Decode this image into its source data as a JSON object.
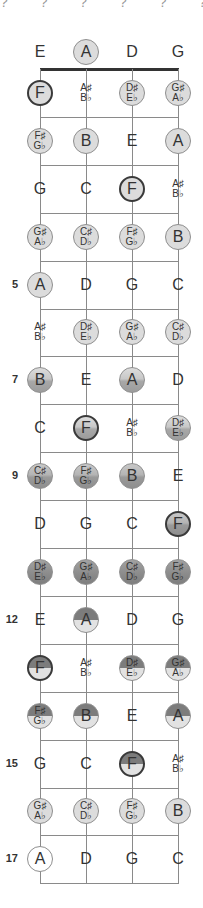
{
  "diagram": {
    "title_cut": "?  ?  ?  ?  ?  ?  ?",
    "strings": [
      "E",
      "A",
      "D",
      "G"
    ],
    "string_x": [
      40,
      86,
      132,
      178
    ],
    "nut_y": 69,
    "fret_spacing": 47.9,
    "fret_count": 17,
    "open_row_y": 52,
    "colors": {
      "line": "#8a8a8a",
      "nut": "#333333",
      "light": "#dcdcdc",
      "dark_split_top": "#7c7c7c",
      "root_border": "#3a3a3a"
    },
    "fret_markers": [
      {
        "fret": 5,
        "label": "5"
      },
      {
        "fret": 7,
        "label": "7"
      },
      {
        "fret": 9,
        "label": "9"
      },
      {
        "fret": 12,
        "label": "12"
      },
      {
        "fret": 15,
        "label": "15"
      },
      {
        "fret": 17,
        "label": "17"
      }
    ],
    "rows": [
      {
        "fret": 0,
        "cells": [
          {
            "n": [
              "E"
            ],
            "c": 0,
            "s": "none"
          },
          {
            "n": [
              "A"
            ],
            "c": 1,
            "s": "light"
          },
          {
            "n": [
              "D"
            ],
            "c": 0,
            "s": "none"
          },
          {
            "n": [
              "G"
            ],
            "c": 0,
            "s": "none"
          }
        ]
      },
      {
        "fret": 1,
        "cells": [
          {
            "n": [
              "F"
            ],
            "c": 1,
            "s": "light",
            "root": 1
          },
          {
            "n": [
              "A♯",
              "B♭"
            ],
            "c": 0,
            "s": "none"
          },
          {
            "n": [
              "D♯",
              "E♭"
            ],
            "c": 1,
            "s": "light"
          },
          {
            "n": [
              "G♯",
              "A♭"
            ],
            "c": 1,
            "s": "light"
          }
        ]
      },
      {
        "fret": 2,
        "cells": [
          {
            "n": [
              "F♯",
              "G♭"
            ],
            "c": 1,
            "s": "light"
          },
          {
            "n": [
              "B"
            ],
            "c": 1,
            "s": "light"
          },
          {
            "n": [
              "E"
            ],
            "c": 0,
            "s": "none"
          },
          {
            "n": [
              "A"
            ],
            "c": 1,
            "s": "light"
          }
        ]
      },
      {
        "fret": 3,
        "cells": [
          {
            "n": [
              "G"
            ],
            "c": 0,
            "s": "none"
          },
          {
            "n": [
              "C"
            ],
            "c": 0,
            "s": "none"
          },
          {
            "n": [
              "F"
            ],
            "c": 1,
            "s": "light",
            "root": 1
          },
          {
            "n": [
              "A♯",
              "B♭"
            ],
            "c": 0,
            "s": "none"
          }
        ]
      },
      {
        "fret": 4,
        "cells": [
          {
            "n": [
              "G♯",
              "A♭"
            ],
            "c": 1,
            "s": "light"
          },
          {
            "n": [
              "C♯",
              "D♭"
            ],
            "c": 1,
            "s": "light"
          },
          {
            "n": [
              "F♯",
              "G♭"
            ],
            "c": 1,
            "s": "light"
          },
          {
            "n": [
              "B"
            ],
            "c": 1,
            "s": "light"
          }
        ]
      },
      {
        "fret": 5,
        "cells": [
          {
            "n": [
              "A"
            ],
            "c": 1,
            "s": "light"
          },
          {
            "n": [
              "D"
            ],
            "c": 0,
            "s": "none"
          },
          {
            "n": [
              "G"
            ],
            "c": 0,
            "s": "none"
          },
          {
            "n": [
              "C"
            ],
            "c": 0,
            "s": "none"
          }
        ]
      },
      {
        "fret": 6,
        "cells": [
          {
            "n": [
              "A♯",
              "B♭"
            ],
            "c": 0,
            "s": "none"
          },
          {
            "n": [
              "D♯",
              "E♭"
            ],
            "c": 1,
            "s": "light"
          },
          {
            "n": [
              "G♯",
              "A♭"
            ],
            "c": 1,
            "s": "light"
          },
          {
            "n": [
              "C♯",
              "D♭"
            ],
            "c": 1,
            "s": "light"
          }
        ]
      },
      {
        "fret": 7,
        "cells": [
          {
            "n": [
              "B"
            ],
            "c": 1,
            "s": "grad1"
          },
          {
            "n": [
              "E"
            ],
            "c": 0,
            "s": "none"
          },
          {
            "n": [
              "A"
            ],
            "c": 1,
            "s": "grad1"
          },
          {
            "n": [
              "D"
            ],
            "c": 0,
            "s": "none"
          }
        ]
      },
      {
        "fret": 8,
        "cells": [
          {
            "n": [
              "C"
            ],
            "c": 0,
            "s": "none"
          },
          {
            "n": [
              "F"
            ],
            "c": 1,
            "s": "grad1",
            "root": 1
          },
          {
            "n": [
              "A♯",
              "B♭"
            ],
            "c": 0,
            "s": "none"
          },
          {
            "n": [
              "D♯",
              "E♭"
            ],
            "c": 1,
            "s": "grad1"
          }
        ]
      },
      {
        "fret": 9,
        "cells": [
          {
            "n": [
              "C♯",
              "D♭"
            ],
            "c": 1,
            "s": "grad2"
          },
          {
            "n": [
              "F♯",
              "G♭"
            ],
            "c": 1,
            "s": "grad2"
          },
          {
            "n": [
              "B"
            ],
            "c": 1,
            "s": "grad2"
          },
          {
            "n": [
              "E"
            ],
            "c": 0,
            "s": "none"
          }
        ]
      },
      {
        "fret": 10,
        "cells": [
          {
            "n": [
              "D"
            ],
            "c": 0,
            "s": "none"
          },
          {
            "n": [
              "G"
            ],
            "c": 0,
            "s": "none"
          },
          {
            "n": [
              "C"
            ],
            "c": 0,
            "s": "none"
          },
          {
            "n": [
              "F"
            ],
            "c": 1,
            "s": "grad2",
            "root": 1
          }
        ]
      },
      {
        "fret": 11,
        "cells": [
          {
            "n": [
              "D♯",
              "E♭"
            ],
            "c": 1,
            "s": "dark"
          },
          {
            "n": [
              "G♯",
              "A♭"
            ],
            "c": 1,
            "s": "dark"
          },
          {
            "n": [
              "C♯",
              "D♭"
            ],
            "c": 1,
            "s": "dark"
          },
          {
            "n": [
              "F♯",
              "G♭"
            ],
            "c": 1,
            "s": "dark"
          }
        ]
      },
      {
        "fret": 12,
        "cells": [
          {
            "n": [
              "E"
            ],
            "c": 0,
            "s": "none"
          },
          {
            "n": [
              "A"
            ],
            "c": 1,
            "s": "split"
          },
          {
            "n": [
              "D"
            ],
            "c": 0,
            "s": "none"
          },
          {
            "n": [
              "G"
            ],
            "c": 0,
            "s": "none"
          }
        ]
      },
      {
        "fret": 13,
        "cells": [
          {
            "n": [
              "F"
            ],
            "c": 1,
            "s": "split",
            "root": 1
          },
          {
            "n": [
              "A♯",
              "B♭"
            ],
            "c": 0,
            "s": "none"
          },
          {
            "n": [
              "D♯",
              "E♭"
            ],
            "c": 1,
            "s": "split"
          },
          {
            "n": [
              "G♯",
              "A♭"
            ],
            "c": 1,
            "s": "split"
          }
        ]
      },
      {
        "fret": 14,
        "cells": [
          {
            "n": [
              "F♯",
              "G♭"
            ],
            "c": 1,
            "s": "split"
          },
          {
            "n": [
              "B"
            ],
            "c": 1,
            "s": "split"
          },
          {
            "n": [
              "E"
            ],
            "c": 0,
            "s": "none"
          },
          {
            "n": [
              "A"
            ],
            "c": 1,
            "s": "split"
          }
        ]
      },
      {
        "fret": 15,
        "cells": [
          {
            "n": [
              "G"
            ],
            "c": 0,
            "s": "none"
          },
          {
            "n": [
              "C"
            ],
            "c": 0,
            "s": "none"
          },
          {
            "n": [
              "F"
            ],
            "c": 1,
            "s": "split",
            "root": 1
          },
          {
            "n": [
              "A♯",
              "B♭"
            ],
            "c": 0,
            "s": "none"
          }
        ]
      },
      {
        "fret": 16,
        "cells": [
          {
            "n": [
              "G♯",
              "A♭"
            ],
            "c": 1,
            "s": "light"
          },
          {
            "n": [
              "C♯",
              "D♭"
            ],
            "c": 1,
            "s": "light"
          },
          {
            "n": [
              "F♯",
              "G♭"
            ],
            "c": 1,
            "s": "light"
          },
          {
            "n": [
              "B"
            ],
            "c": 1,
            "s": "light"
          }
        ]
      },
      {
        "fret": 17,
        "cells": [
          {
            "n": [
              "A"
            ],
            "c": 1,
            "s": "white"
          },
          {
            "n": [
              "D"
            ],
            "c": 0,
            "s": "none"
          },
          {
            "n": [
              "G"
            ],
            "c": 0,
            "s": "none"
          },
          {
            "n": [
              "C"
            ],
            "c": 0,
            "s": "none"
          }
        ]
      }
    ]
  }
}
